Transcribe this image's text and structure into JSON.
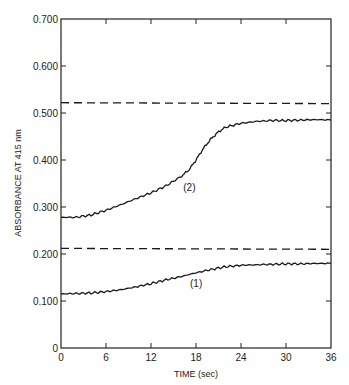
{
  "chart_data": {
    "type": "line",
    "title": "",
    "xlabel": "TIME (sec)",
    "ylabel": "ABSORBANCE AT 415 nm",
    "xlim": [
      0,
      36
    ],
    "ylim": [
      0,
      0.7
    ],
    "x_ticks": [
      0,
      6,
      12,
      18,
      24,
      30,
      36
    ],
    "x_tick_labels": [
      "0",
      "6",
      "12",
      "18",
      "24",
      "30",
      "36"
    ],
    "y_ticks": [
      0,
      0.1,
      0.2,
      0.3,
      0.4,
      0.5,
      0.6,
      0.7
    ],
    "y_tick_labels": [
      "0",
      "0.100",
      "0.200",
      "0.300",
      "0.400",
      "0.500",
      "0.600",
      "0.700"
    ],
    "grid": false,
    "legend": "none",
    "series": [
      {
        "name": "(2)",
        "style": "solid",
        "label_at": [
          16.3,
          0.335
        ],
        "x": [
          0,
          2,
          4,
          6,
          8,
          10,
          12,
          14,
          16,
          17,
          18,
          19,
          20,
          21,
          22,
          24,
          26,
          28,
          30,
          32,
          34,
          36
        ],
        "values": [
          0.278,
          0.278,
          0.283,
          0.293,
          0.305,
          0.318,
          0.33,
          0.345,
          0.365,
          0.378,
          0.4,
          0.425,
          0.445,
          0.46,
          0.47,
          0.478,
          0.482,
          0.484,
          0.484,
          0.485,
          0.486,
          0.485
        ]
      },
      {
        "name": "(1)",
        "style": "solid",
        "label_at": [
          17.2,
          0.13
        ],
        "x": [
          0,
          2,
          4,
          6,
          8,
          10,
          12,
          14,
          16,
          18,
          20,
          22,
          24,
          26,
          28,
          30,
          32,
          34,
          36
        ],
        "values": [
          0.115,
          0.116,
          0.117,
          0.12,
          0.124,
          0.13,
          0.137,
          0.145,
          0.152,
          0.16,
          0.167,
          0.173,
          0.176,
          0.177,
          0.178,
          0.179,
          0.179,
          0.18,
          0.18
        ]
      },
      {
        "name": "upper dashed reference",
        "style": "dashed",
        "x": [
          0,
          36
        ],
        "values": [
          0.522,
          0.52
        ]
      },
      {
        "name": "lower dashed reference",
        "style": "dashed",
        "x": [
          0,
          36
        ],
        "values": [
          0.212,
          0.21
        ]
      }
    ]
  }
}
